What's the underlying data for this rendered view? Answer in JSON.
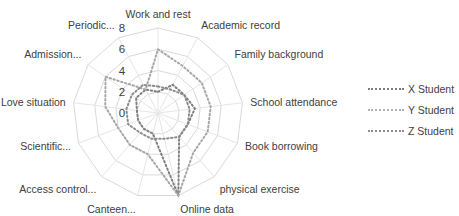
{
  "chart_data": {
    "type": "radar",
    "title": "",
    "categories": [
      "Work and rest",
      "Academic record",
      "Family background",
      "School attendance",
      "Book borrowing",
      "physical exercise",
      "Online data",
      "Canteen...",
      "Access control...",
      "Scientific...",
      "Love situation",
      "Admission...",
      "Periodic..."
    ],
    "axis": {
      "min": 0,
      "max": 8,
      "ticks": [
        "0",
        "2",
        "4",
        "6",
        "8"
      ]
    },
    "grid": true,
    "legend_position": "right",
    "series": [
      {
        "name": "X Student",
        "color": "#7f7f7f",
        "values": [
          2,
          3,
          3,
          3.5,
          3,
          3,
          8,
          2,
          2,
          2,
          2,
          2.5,
          2.5
        ]
      },
      {
        "name": "Y Student",
        "color": "#a6a6a6",
        "values": [
          6,
          5,
          5,
          5,
          5,
          5,
          8,
          4,
          4,
          4,
          5,
          6,
          2.5
        ]
      },
      {
        "name": "Z Student",
        "color": "#8c8c8c",
        "values": [
          2.5,
          2.5,
          3,
          3,
          3,
          3,
          2.5,
          2.5,
          2.5,
          3,
          3,
          3,
          3
        ]
      }
    ]
  },
  "legend": {
    "items": [
      {
        "label": "X Student"
      },
      {
        "label": "Y Student"
      },
      {
        "label": "Z Student"
      }
    ]
  }
}
